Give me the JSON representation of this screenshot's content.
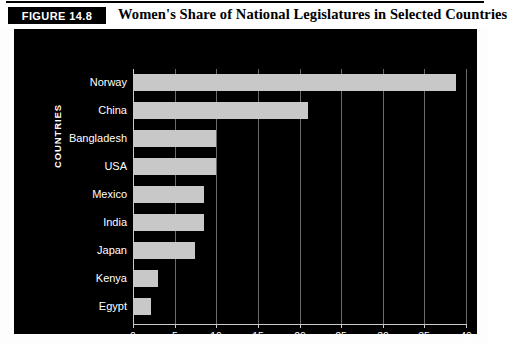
{
  "header": {
    "badge": "FIGURE 14.8",
    "title": "Women's Share of National Legislatures in Selected Countries"
  },
  "colors": {
    "panel_background": "#000000",
    "bar_fill": "#c8c8c8",
    "gridline": "#6a6a6a",
    "text": "#ffffff",
    "page_background": "#ffffff"
  },
  "chart_data": {
    "type": "bar",
    "orientation": "horizontal",
    "title": "Women's Share of National Legislatures in Selected Countries",
    "xlabel": "PERCENTAGES",
    "ylabel": "COUNTRIES",
    "xlim": [
      0,
      40
    ],
    "xticks": [
      0,
      5,
      10,
      15,
      20,
      25,
      30,
      35,
      40
    ],
    "xtick_labels": [
      "0",
      "5",
      "10",
      "15",
      "20",
      "25",
      "30",
      "35",
      "40"
    ],
    "grid": true,
    "legend": false,
    "categories": [
      "Norway",
      "China",
      "Bangladesh",
      "USA",
      "Mexico",
      "India",
      "Japan",
      "Kenya",
      "Egypt"
    ],
    "values": [
      38.8,
      21.0,
      10.0,
      10.0,
      8.5,
      8.5,
      7.5,
      3.0,
      2.2
    ]
  }
}
